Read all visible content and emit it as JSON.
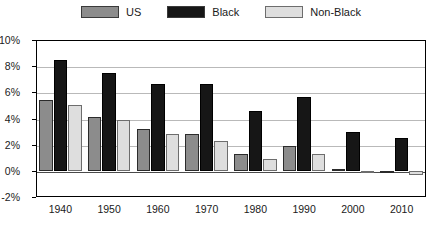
{
  "chart_data": {
    "type": "bar",
    "title": "",
    "subtitle": "",
    "xlabel": "",
    "ylabel": "",
    "categories": [
      "1940",
      "1950",
      "1960",
      "1970",
      "1980",
      "1990",
      "2000",
      "2010"
    ],
    "series": [
      {
        "name": "US",
        "color": "#8c8c8c",
        "values": [
          5.4,
          4.1,
          3.2,
          2.8,
          1.3,
          1.9,
          0.15,
          -0.05
        ]
      },
      {
        "name": "Black",
        "color": "#161616",
        "values": [
          8.5,
          7.5,
          6.65,
          6.6,
          4.6,
          5.65,
          3.0,
          2.5
        ]
      },
      {
        "name": "Non-Black",
        "color": "#dedede",
        "values": [
          5.0,
          3.85,
          2.8,
          2.3,
          0.9,
          1.3,
          -0.15,
          -0.35
        ]
      }
    ],
    "ylim": [
      -2,
      10
    ],
    "ytick_values": [
      10,
      8,
      6,
      4,
      2,
      0,
      -2
    ],
    "ytick_labels": [
      "10%",
      "8%",
      "6%",
      "4%",
      "2%",
      "0%",
      "-2%"
    ],
    "grid": true,
    "legend_position": "top-center",
    "value_suffix": "%"
  },
  "legend": {
    "entries": [
      {
        "label": "US"
      },
      {
        "label": "Black"
      },
      {
        "label": "Non-Black"
      }
    ]
  }
}
